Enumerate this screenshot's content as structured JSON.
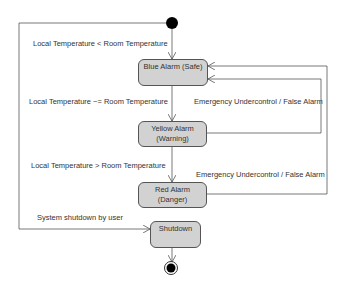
{
  "diagram": {
    "type": "state-machine",
    "states": [
      {
        "id": "blue",
        "line1": "Blue Alarm (Safe)",
        "line2": ""
      },
      {
        "id": "yellow",
        "line1": "Yellow Alarm",
        "line2": "(Warning)"
      },
      {
        "id": "red",
        "line1": "Red Alarm",
        "line2": "(Danger)"
      },
      {
        "id": "shutdown",
        "line1": "Shutdown",
        "line2": ""
      }
    ],
    "transitions": [
      {
        "from": "start",
        "to": "blue",
        "label": "Local Temperature < Room Temperature"
      },
      {
        "from": "blue",
        "to": "yellow",
        "label": "Local Temperature ~= Room Temperature"
      },
      {
        "from": "yellow",
        "to": "red",
        "label": "Local Temperature > Room Temperature"
      },
      {
        "from": "yellow",
        "to": "blue",
        "label": "Emergency Undercontrol / False Alarm"
      },
      {
        "from": "red",
        "to": "blue",
        "label": "Emergency Undercontrol / False Alarm"
      },
      {
        "from": "start",
        "to": "shutdown",
        "label": "System shutdown by user"
      },
      {
        "from": "shutdown",
        "to": "end",
        "label": ""
      }
    ],
    "colors": {
      "state_fill": "#d2d2d2",
      "stroke": "#555555",
      "node": "#000000"
    }
  }
}
